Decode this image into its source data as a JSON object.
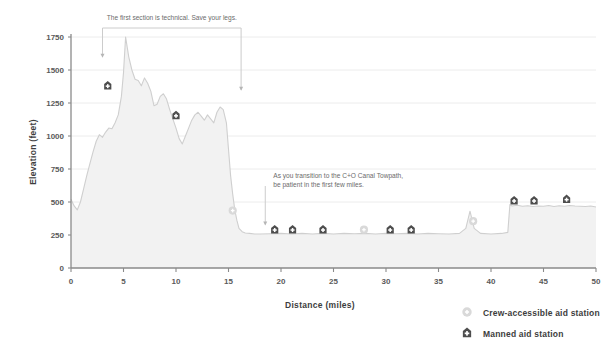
{
  "chart_data": {
    "type": "area",
    "title": "",
    "xlabel": "Distance (miles)",
    "ylabel": "Elevation (feet)",
    "xlim": [
      0,
      50
    ],
    "ylim": [
      0,
      1750
    ],
    "xticks": [
      0,
      5,
      10,
      15,
      20,
      25,
      30,
      35,
      40,
      45,
      50
    ],
    "yticks": [
      0,
      250,
      500,
      750,
      1000,
      1250,
      1500,
      1750
    ],
    "grid": "horizontal",
    "legend_position": "bottom-right",
    "series": [
      {
        "name": "Elevation profile",
        "fill_color": "#f2f2f2",
        "line_color": "#cfcfcf",
        "x": [
          0,
          0.3,
          0.6,
          0.9,
          1.2,
          1.5,
          1.8,
          2.1,
          2.4,
          2.7,
          3.0,
          3.3,
          3.6,
          3.9,
          4.2,
          4.5,
          4.8,
          5.0,
          5.2,
          5.5,
          5.8,
          6.1,
          6.4,
          6.7,
          7.0,
          7.3,
          7.6,
          7.9,
          8.2,
          8.5,
          8.8,
          9.1,
          9.4,
          9.7,
          10.0,
          10.3,
          10.6,
          10.9,
          11.2,
          11.5,
          11.8,
          12.1,
          12.4,
          12.7,
          13.0,
          13.3,
          13.6,
          13.9,
          14.2,
          14.5,
          14.8,
          15.0,
          15.2,
          15.4,
          15.6,
          15.8,
          16.0,
          16.3,
          16.6,
          17.0,
          17.5,
          18.0,
          19.0,
          20.0,
          21.0,
          22.0,
          23.0,
          24.0,
          25.0,
          26.0,
          27.0,
          28.0,
          29.0,
          30.0,
          31.0,
          32.0,
          33.0,
          34.0,
          35.0,
          36.0,
          37.0,
          37.6,
          38.0,
          38.4,
          39.0,
          40.0,
          41.0,
          41.6,
          41.8,
          42.0,
          42.5,
          43.0,
          43.5,
          44.0,
          44.5,
          45.0,
          45.5,
          46.0,
          46.5,
          47.0,
          47.5,
          48.0,
          48.5,
          49.0,
          49.5,
          50.0
        ],
        "y": [
          520,
          470,
          440,
          500,
          600,
          700,
          790,
          880,
          960,
          1010,
          990,
          1030,
          1060,
          1055,
          1100,
          1160,
          1300,
          1480,
          1750,
          1600,
          1500,
          1430,
          1420,
          1380,
          1440,
          1400,
          1340,
          1230,
          1240,
          1300,
          1320,
          1280,
          1200,
          1130,
          1060,
          980,
          940,
          1000,
          1060,
          1120,
          1160,
          1180,
          1150,
          1120,
          1160,
          1130,
          1100,
          1180,
          1220,
          1200,
          1100,
          900,
          700,
          560,
          440,
          360,
          300,
          275,
          265,
          262,
          258,
          258,
          260,
          262,
          258,
          262,
          258,
          262,
          258,
          262,
          260,
          262,
          258,
          262,
          260,
          262,
          258,
          262,
          260,
          258,
          262,
          300,
          430,
          300,
          262,
          258,
          262,
          270,
          480,
          470,
          475,
          468,
          472,
          466,
          470,
          468,
          474,
          466,
          472,
          468,
          474,
          470,
          468,
          466,
          470,
          462
        ],
        "annotations": [
          {
            "text": "The first section is technical. Save your legs.",
            "type": "bracket",
            "x_start": 3.0,
            "x_end": 16.2,
            "y_left": 1600,
            "y_right": 1350
          },
          {
            "text": "As you transition to the C+O Canal Towpath, be patient in the first few miles.",
            "type": "arrow",
            "x": 18.5,
            "y": 300
          }
        ]
      }
    ],
    "markers": [
      {
        "type": "manned",
        "x": 3.5,
        "y": 1380
      },
      {
        "type": "manned",
        "x": 10.0,
        "y": 1155
      },
      {
        "type": "crew",
        "x": 15.4,
        "y": 435
      },
      {
        "type": "manned",
        "x": 19.4,
        "y": 290
      },
      {
        "type": "manned",
        "x": 21.1,
        "y": 290
      },
      {
        "type": "manned",
        "x": 24.0,
        "y": 290
      },
      {
        "type": "crew",
        "x": 27.9,
        "y": 290
      },
      {
        "type": "manned",
        "x": 30.4,
        "y": 290
      },
      {
        "type": "manned",
        "x": 32.4,
        "y": 290
      },
      {
        "type": "crew",
        "x": 38.3,
        "y": 355
      },
      {
        "type": "manned",
        "x": 42.2,
        "y": 510
      },
      {
        "type": "manned",
        "x": 44.1,
        "y": 510
      },
      {
        "type": "manned",
        "x": 47.2,
        "y": 520
      }
    ],
    "legend": [
      {
        "icon": "crew-aid-circle-icon",
        "label": "Crew-accessible aid station"
      },
      {
        "icon": "manned-aid-house-icon",
        "label": "Manned aid station"
      }
    ]
  },
  "colors": {
    "area_fill": "#f2f2f2",
    "area_line": "#cfcfcf",
    "axis": "#8a8a8a",
    "grid": "#ececec",
    "marker_dark": "#4d4d4d",
    "marker_light": "#d9d9d9",
    "text": "#3d3d3d"
  }
}
